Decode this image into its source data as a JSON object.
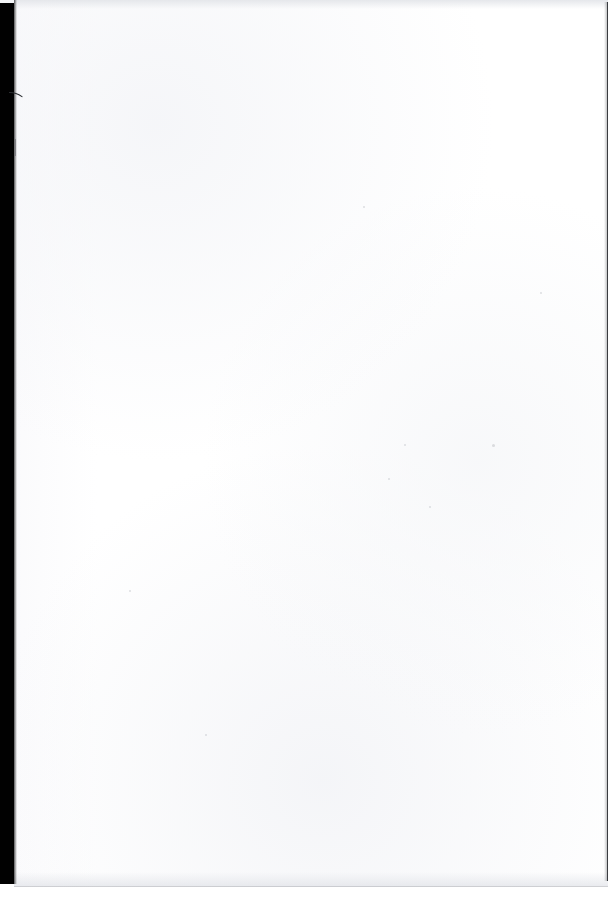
{
  "document": {
    "kind": "scanned-page",
    "page_state": "blank",
    "visible_text": "",
    "page_width_px": 614,
    "page_height_px": 901
  },
  "colors": {
    "page_background": "#ffffff",
    "gutter_band": "#010101",
    "page_edge_line": "#3a3c40",
    "scan_tone": "#f4f5f7",
    "speck": "#96989f"
  },
  "regions": {
    "gutter": {
      "name": "scanner-gutter-shadow",
      "left_px": 0,
      "top_px": 0,
      "width_px": 14,
      "height_px": 884
    },
    "paper": {
      "name": "paper-surface",
      "left_px": 14,
      "top_px": 0,
      "width_px": 595,
      "height_px": 887
    },
    "right_edge": {
      "name": "page-right-edge",
      "left_px": 607,
      "top_px": 2,
      "height_px": 879
    },
    "bottom_edge": {
      "name": "page-bottom-edge",
      "top_px": 886
    },
    "top_band": {
      "name": "page-top-scan-band",
      "top_px": 0,
      "height_px": 9
    }
  },
  "artifacts": {
    "curve": {
      "name": "hairline-curve-artifact",
      "anchor_x_px": 9,
      "anchor_y_px": 93
    },
    "edge_tick": {
      "name": "gutter-edge-tick",
      "left_px": 15,
      "top_px": 139,
      "height_px": 17
    },
    "specks": [
      {
        "x_px": 363,
        "y_px": 206,
        "size_px": 2
      },
      {
        "x_px": 492,
        "y_px": 444,
        "size_px": 3
      },
      {
        "x_px": 429,
        "y_px": 506,
        "size_px": 2
      },
      {
        "x_px": 388,
        "y_px": 478,
        "size_px": 2
      },
      {
        "x_px": 129,
        "y_px": 590,
        "size_px": 2
      },
      {
        "x_px": 404,
        "y_px": 444,
        "size_px": 2
      },
      {
        "x_px": 205,
        "y_px": 734,
        "size_px": 2
      },
      {
        "x_px": 540,
        "y_px": 292,
        "size_px": 2
      }
    ]
  }
}
